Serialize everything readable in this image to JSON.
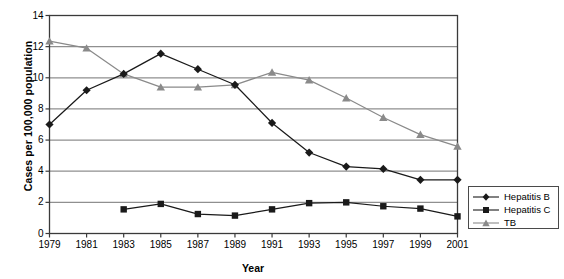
{
  "chart_data": {
    "type": "line",
    "title": "",
    "xlabel": "Year",
    "ylabel": "Cases per 100,000 population",
    "categories": [
      1979,
      1981,
      1983,
      1985,
      1987,
      1989,
      1991,
      1993,
      1995,
      1997,
      1999,
      2001
    ],
    "xtick_labels": [
      "1979",
      "1981",
      "1983",
      "1985",
      "1987",
      "1989",
      "1991",
      "1993",
      "1995",
      "1997",
      "1999",
      "2001"
    ],
    "ytick_labels": [
      "0",
      "2",
      "4",
      "6",
      "8",
      "10",
      "12",
      "14"
    ],
    "ytick_values": [
      0,
      2,
      4,
      6,
      8,
      10,
      12,
      14
    ],
    "ylim": [
      0,
      14
    ],
    "grid": "horizontal",
    "legend_position": "right-bottom-outside",
    "series": [
      {
        "name": "Hepatitis B",
        "marker": "diamond",
        "color": "#1a1a1a",
        "values": [
          7.0,
          9.2,
          10.25,
          11.55,
          10.55,
          9.55,
          7.1,
          5.2,
          4.3,
          4.15,
          3.45,
          3.45
        ]
      },
      {
        "name": "Hepatitis C",
        "marker": "square",
        "color": "#1a1a1a",
        "values": [
          null,
          null,
          1.55,
          1.9,
          1.25,
          1.15,
          1.55,
          1.95,
          2.0,
          1.75,
          1.6,
          1.1
        ]
      },
      {
        "name": "TB",
        "marker": "triangle",
        "color": "#8a8a8a",
        "values": [
          12.35,
          11.9,
          10.25,
          9.4,
          9.4,
          9.55,
          10.35,
          9.85,
          8.7,
          7.45,
          6.35,
          5.6
        ]
      }
    ]
  },
  "legend": {
    "items": [
      {
        "label": "Hepatitis B"
      },
      {
        "label": "Hepatitis C"
      },
      {
        "label": "TB"
      }
    ]
  },
  "colors": {
    "plot_border": "#3a3a3a",
    "gridline": "#8f8f8f",
    "series_black": "#1a1a1a",
    "series_gray": "#8a8a8a",
    "background": "#ffffff"
  }
}
